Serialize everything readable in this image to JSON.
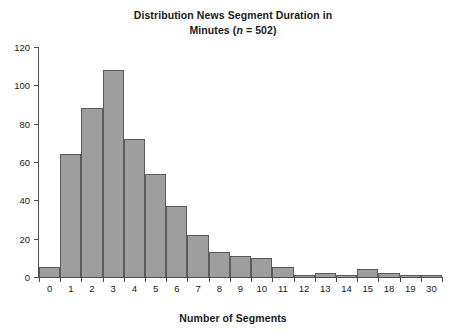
{
  "chart_data": {
    "type": "bar",
    "title": "Distribution News Segment Duration in Minutes (n = 502)",
    "title_line1": "Distribution News Segment Duration in",
    "title_line2_prefix": "Minutes (",
    "title_n_symbol": "n",
    "title_line2_suffix": " = 502)",
    "xlabel": "Number of Segments",
    "ylabel": "",
    "categories": [
      "0",
      "1",
      "2",
      "3",
      "4",
      "5",
      "6",
      "7",
      "8",
      "9",
      "10",
      "11",
      "12",
      "13",
      "14",
      "15",
      "18",
      "19",
      "30"
    ],
    "values": [
      5,
      64,
      88,
      108,
      72,
      54,
      37,
      22,
      13,
      11,
      10,
      5,
      1,
      2,
      1,
      4,
      2,
      1,
      1
    ],
    "ylim": [
      0,
      120
    ],
    "ytick_labels": [
      "0",
      "20",
      "40",
      "60",
      "80",
      "100",
      "120"
    ],
    "ytick_values": [
      0,
      20,
      40,
      60,
      80,
      100,
      120
    ],
    "grid": false,
    "legend": "none",
    "sample_size": 502,
    "bar_fill_color": "#9e9e9e",
    "bar_edge_color": "#5a5a5a",
    "axis_color": "#4d4d4d",
    "background_color": "#ffffff",
    "text_color": "#1a1a1a"
  }
}
